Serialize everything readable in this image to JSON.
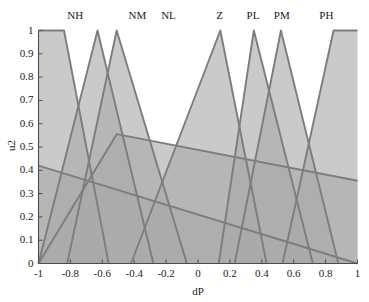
{
  "chart_data": {
    "type": "line",
    "title": "",
    "subtitle": "",
    "xlabel": "dP",
    "ylabel": "u2",
    "xlim": [
      -1,
      1
    ],
    "ylim": [
      0,
      1
    ],
    "grid": false,
    "legend_position": "top-inline-labels",
    "fill": true,
    "x_ticks": [
      -1,
      -0.8,
      -0.6,
      -0.4,
      -0.2,
      0,
      0.2,
      0.4,
      0.6,
      0.8,
      1
    ],
    "x_tick_labels": [
      "-1",
      "-0.8",
      "-0.6",
      "-0.4",
      "-0.2",
      "0",
      "0.2",
      "0.4",
      "0.6",
      "0.8",
      "1"
    ],
    "y_ticks": [
      0,
      0.1,
      0.2,
      0.3,
      0.4,
      0.5,
      0.6,
      0.7,
      0.8,
      0.9,
      1
    ],
    "y_tick_labels": [
      "0",
      "0.1",
      "0.2",
      "0.3",
      "0.4",
      "0.5",
      "0.6",
      "0.7",
      "0.8",
      "0.9",
      "1"
    ],
    "colors": {
      "fill": "#a9a9a9",
      "line": "#7d7d7d",
      "axis": "#4d4d4d",
      "text": "#1a1a1a",
      "background": "#ffffff"
    },
    "series": [
      {
        "name": "NH",
        "label_x": -0.77,
        "x": [
          -1,
          -0.84,
          -0.56
        ],
        "values": [
          1,
          1,
          0
        ]
      },
      {
        "name": "NM",
        "label_x": -0.38,
        "x": [
          -1,
          -0.63,
          -0.28
        ],
        "values": [
          0,
          1,
          0
        ]
      },
      {
        "name": "NL",
        "label_x": -0.185,
        "x": [
          -0.82,
          -0.51,
          -0.07
        ],
        "values": [
          0,
          1,
          0
        ]
      },
      {
        "name": "Z",
        "label_x": 0.135,
        "x": [
          -0.42,
          0.14,
          0.43
        ],
        "values": [
          0,
          1,
          0
        ]
      },
      {
        "name": "PL",
        "label_x": 0.345,
        "x": [
          0.13,
          0.35,
          0.72
        ],
        "values": [
          0,
          1,
          0
        ]
      },
      {
        "name": "PM",
        "label_x": 0.525,
        "x": [
          0.23,
          0.52,
          0.88
        ],
        "values": [
          0,
          1,
          0
        ]
      },
      {
        "name": "PH",
        "label_x": 0.805,
        "x": [
          0.53,
          0.85,
          1
        ],
        "values": [
          0,
          1,
          1
        ]
      },
      {
        "name": "NH-wide",
        "label_x": null,
        "x": [
          -1,
          1
        ],
        "values": [
          0.42,
          0.0
        ]
      },
      {
        "name": "NL-wide",
        "label_x": null,
        "x": [
          -1,
          -0.51,
          1
        ],
        "values": [
          0.0,
          0.555,
          0.355
        ]
      }
    ],
    "annotations": [
      {
        "text": "NH",
        "x": -0.77,
        "y": 1.06
      },
      {
        "text": "NM",
        "x": -0.38,
        "y": 1.06
      },
      {
        "text": "NL",
        "x": -0.185,
        "y": 1.06
      },
      {
        "text": "Z",
        "x": 0.135,
        "y": 1.06
      },
      {
        "text": "PL",
        "x": 0.345,
        "y": 1.06
      },
      {
        "text": "PM",
        "x": 0.525,
        "y": 1.06
      },
      {
        "text": "PH",
        "x": 0.805,
        "y": 1.06
      }
    ]
  }
}
